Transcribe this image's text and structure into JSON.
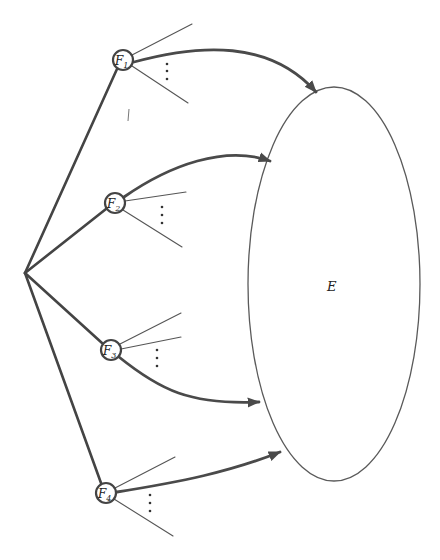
{
  "diagram": {
    "type": "tree-to-set",
    "root": {
      "x": 25,
      "y": 273
    },
    "nodes": [
      {
        "id": "F1",
        "base": "F",
        "sub": "1",
        "x": 123,
        "y": 60
      },
      {
        "id": "F2",
        "base": "F",
        "sub": "2",
        "x": 115,
        "y": 203
      },
      {
        "id": "F3",
        "base": "F",
        "sub": "3",
        "x": 111,
        "y": 350
      },
      {
        "id": "F4",
        "base": "F",
        "sub": "4",
        "x": 106,
        "y": 493
      }
    ],
    "set": {
      "label": "E",
      "cx": 334,
      "cy": 284,
      "rx": 86,
      "ry": 197
    },
    "branches_note": "Each F node has unlabeled outgoing branches with vertical ellipsis dots indicating continuation",
    "ellipsis": "⋮",
    "arrows": [
      {
        "from": "F1",
        "to": "E"
      },
      {
        "from": "F2",
        "to": "E"
      },
      {
        "from": "F3",
        "to": "E"
      },
      {
        "from": "F4",
        "to": "E"
      }
    ],
    "colors": {
      "line": "#444444",
      "background": "#ffffff"
    }
  }
}
